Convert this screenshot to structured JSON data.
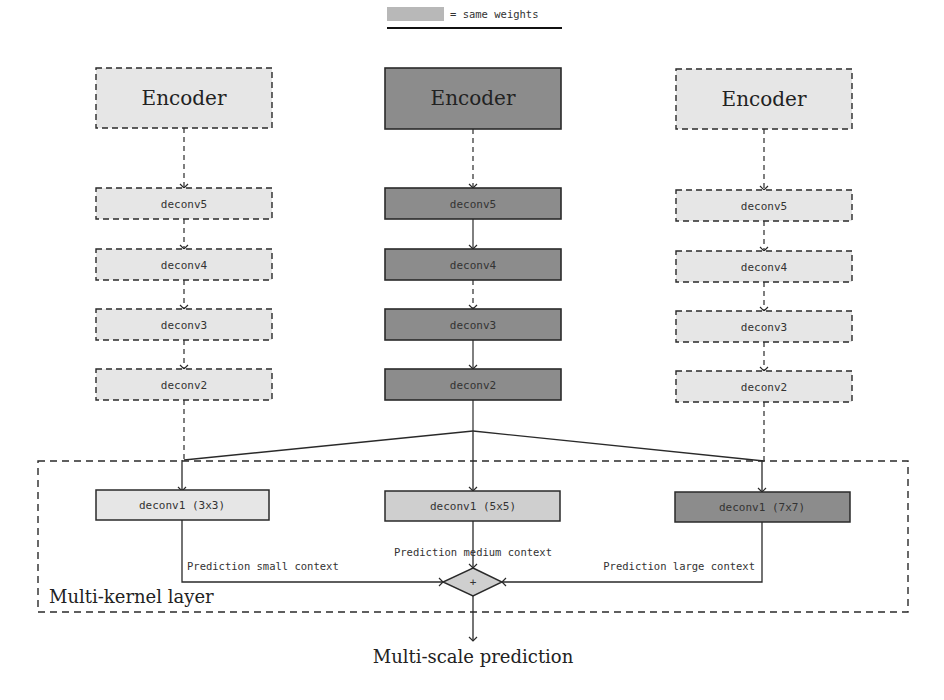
{
  "legend": {
    "label": "= same weights",
    "swatch_color": "#b8b8b8"
  },
  "colors": {
    "light_fill": "#e6e6e6",
    "mid_fill": "#cfcfcf",
    "dark_fill": "#8c8c8c",
    "stroke": "#2a2a2a"
  },
  "columns": {
    "left": {
      "encoder": "Encoder",
      "deconvs": [
        "deconv5",
        "deconv4",
        "deconv3",
        "deconv2"
      ],
      "style": "dashed-light"
    },
    "middle": {
      "encoder": "Encoder",
      "deconvs": [
        "deconv5",
        "deconv4",
        "deconv3",
        "deconv2"
      ],
      "style": "solid-dark"
    },
    "right": {
      "encoder": "Encoder",
      "deconvs": [
        "deconv5",
        "deconv4",
        "deconv3",
        "deconv2"
      ],
      "style": "dashed-light"
    }
  },
  "multi_kernel_layer": {
    "title": "Multi-kernel layer",
    "kernels": [
      {
        "label": "deconv1 (3x3)",
        "prediction": "Prediction small context"
      },
      {
        "label": "deconv1 (5x5)",
        "prediction": "Prediction medium context"
      },
      {
        "label": "deconv1 (7x7)",
        "prediction": "Prediction large context"
      }
    ],
    "combine_symbol": "+"
  },
  "output": {
    "label": "Multi-scale prediction"
  }
}
